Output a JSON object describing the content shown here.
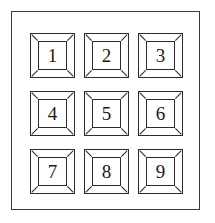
{
  "figure": {
    "name": "keypad-diagram",
    "background_color": "#ffffff",
    "line_color": "#2b2b2b",
    "frame_color": "#3a3a3a"
  },
  "keypad": {
    "frame": {
      "label": "keypad-faceplate"
    },
    "grid": {
      "rows": 3,
      "columns": 3,
      "keys": [
        {
          "label": "1",
          "row": 1,
          "column": 1
        },
        {
          "label": "2",
          "row": 1,
          "column": 2
        },
        {
          "label": "3",
          "row": 1,
          "column": 3
        },
        {
          "label": "4",
          "row": 2,
          "column": 1
        },
        {
          "label": "5",
          "row": 2,
          "column": 2
        },
        {
          "label": "6",
          "row": 2,
          "column": 3
        },
        {
          "label": "7",
          "row": 3,
          "column": 1
        },
        {
          "label": "8",
          "row": 3,
          "column": 2
        },
        {
          "label": "9",
          "row": 3,
          "column": 3
        }
      ]
    }
  }
}
